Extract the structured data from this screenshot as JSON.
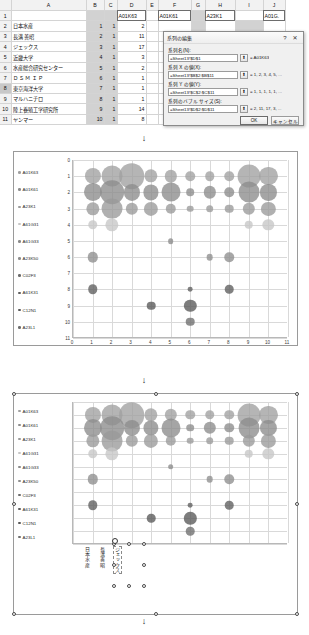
{
  "app": {
    "type": "spreadsheet-bubble-chart-editor"
  },
  "sheet": {
    "column_headers": [
      "A",
      "B",
      "C",
      "D",
      "E",
      "F",
      "G",
      "H",
      "I",
      "J"
    ],
    "row_headers": [
      "1",
      "2",
      "3",
      "4",
      "5",
      "6",
      "7",
      "8",
      "9",
      "10",
      "11"
    ],
    "series_name_cells": {
      "D1": "A01K63",
      "F1": "A01K61",
      "H1": "A23K1",
      "J1": "A01G."
    },
    "row1_numbers": {
      "D2_row": "",
      "E1": "2",
      "F1b": "18",
      "G1": "3",
      "H1b": "12",
      "I1": "4"
    },
    "rows": [
      {
        "r": "2",
        "A": "日本水産",
        "B": "1",
        "C": "1",
        "D": "2"
      },
      {
        "r": "3",
        "A": "長溝 善昭",
        "B": "2",
        "C": "1",
        "D": "11"
      },
      {
        "r": "4",
        "A": "ジェックス",
        "B": "3",
        "C": "1",
        "D": "17"
      },
      {
        "r": "5",
        "A": "近畿大学",
        "B": "4",
        "C": "1",
        "D": "3"
      },
      {
        "r": "6",
        "A": "水産総合研究センター",
        "B": "5",
        "C": "1",
        "D": "2"
      },
      {
        "r": "7",
        "A": "Ｄ Ｓ Ｍ   Ｉ Ｐ",
        "B": "6",
        "C": "1",
        "D": "1"
      },
      {
        "r": "8",
        "A": "東京海洋大学",
        "B": "7",
        "C": "1",
        "D": "1"
      },
      {
        "r": "9",
        "A": "マルハニチロ",
        "B": "8",
        "C": "1",
        "D": "1"
      },
      {
        "r": "10",
        "A": "陸上養殖工学研究所",
        "B": "9",
        "C": "1",
        "D": "14"
      },
      {
        "r": "11",
        "A": "ヤンマー",
        "B": "10",
        "C": "1",
        "D": "8"
      }
    ],
    "selected_row_header": "8",
    "selected_cell": "D1"
  },
  "dialog": {
    "title": "系列の編集",
    "help_label": "?",
    "close_label": "✕",
    "fields": [
      {
        "label": "系列名(N):",
        "value": "=Sheet13!$D$1",
        "preview": "= A01K63"
      },
      {
        "label": "系列 X の値(X):",
        "value": "=Sheet13!$B$2:$B$11",
        "preview": "= 1, 2, 3, 4, 5, ..."
      },
      {
        "label": "系列 Y の値(Y):",
        "value": "=Sheet13!$C$2:$C$11",
        "preview": "= 1, 1, 1, 1, 1, ..."
      },
      {
        "label": "系列のバブル サイズ(S):",
        "value": "=Sheet13!$D$2:$D$11",
        "preview": "= 2, 11, 17, 3, ..."
      }
    ],
    "picker_icon": "range-picker-icon",
    "ok_label": "OK",
    "cancel_label": "キャンセル"
  },
  "chart_data": [
    {
      "id": "chart1",
      "type": "scatter",
      "title": "",
      "xlabel": "",
      "ylabel": "",
      "xlim": [
        0,
        11
      ],
      "ylim": [
        0,
        11
      ],
      "y_inverted": true,
      "grid": true,
      "legend_position": "left",
      "xticks": [
        "0",
        "1",
        "2",
        "3",
        "4",
        "5",
        "6",
        "7",
        "8",
        "9",
        "10",
        "11"
      ],
      "yticks": [
        "0",
        "1",
        "2",
        "3",
        "4",
        "5",
        "6",
        "7",
        "8",
        "9",
        "10",
        "11"
      ],
      "series": [
        {
          "name": "A01K63",
          "color": "#a0a0a0",
          "points": [
            [
              1,
              1,
              17
            ],
            [
              2,
              1,
              22
            ],
            [
              3,
              1,
              27
            ],
            [
              4,
              1,
              14
            ],
            [
              5,
              1,
              13
            ],
            [
              6,
              1,
              10
            ],
            [
              7,
              1,
              10
            ],
            [
              8,
              1,
              10
            ],
            [
              9,
              1,
              24
            ],
            [
              10,
              1,
              19
            ]
          ]
        },
        {
          "name": "A01K61",
          "color": "#8c8c8c",
          "points": [
            [
              1,
              2,
              19
            ],
            [
              2,
              2,
              25
            ],
            [
              3,
              2,
              17
            ],
            [
              4,
              2,
              16
            ],
            [
              5,
              2,
              20
            ],
            [
              6,
              2,
              8
            ],
            [
              7,
              2,
              13
            ],
            [
              8,
              2,
              10
            ],
            [
              9,
              2,
              22
            ],
            [
              10,
              2,
              17
            ]
          ]
        },
        {
          "name": "A23K1",
          "color": "#9a9a9a",
          "points": [
            [
              1,
              3,
              14
            ],
            [
              2,
              3,
              22
            ],
            [
              3,
              3,
              13
            ],
            [
              4,
              3,
              15
            ],
            [
              5,
              3,
              11
            ],
            [
              6,
              3,
              7
            ],
            [
              7,
              3,
              8
            ],
            [
              8,
              3,
              9
            ],
            [
              9,
              3,
              13
            ],
            [
              10,
              3,
              15
            ]
          ]
        },
        {
          "name": "A61G31",
          "color": "#c6c6c6",
          "points": [
            [
              1,
              4,
              10
            ],
            [
              2,
              4,
              14
            ],
            [
              9,
              4,
              9
            ],
            [
              10,
              4,
              12
            ]
          ]
        },
        {
          "name": "A61G33",
          "color": "#8a8a8a",
          "points": [
            [
              5,
              5,
              6
            ]
          ]
        },
        {
          "name": "A23K50",
          "color": "#8e8e8e",
          "points": [
            [
              1,
              6,
              11
            ],
            [
              7,
              6,
              7
            ],
            [
              8,
              6,
              10
            ]
          ]
        },
        {
          "name": "C02F3",
          "color": "#6b6b6b",
          "points": []
        },
        {
          "name": "A61K31",
          "color": "#5e5e5e",
          "points": [
            [
              1,
              8,
              10
            ],
            [
              6,
              8,
              5
            ],
            [
              8,
              8,
              9
            ]
          ]
        },
        {
          "name": "C12N1",
          "color": "#585858",
          "points": [
            [
              4,
              9,
              9
            ],
            [
              6,
              9,
              13
            ]
          ]
        },
        {
          "name": "A23L1",
          "color": "#6e6e6e",
          "points": [
            [
              6,
              10,
              9
            ]
          ]
        }
      ]
    },
    {
      "id": "chart2",
      "type": "scatter",
      "title": "",
      "xlabel": "",
      "ylabel": "",
      "xlim": [
        0,
        11
      ],
      "ylim": [
        0,
        11
      ],
      "y_inverted": true,
      "grid": true,
      "legend_position": "left",
      "category_labels": [
        "日本水産",
        "長溝善昭",
        "ジェックス"
      ],
      "series": [
        {
          "name": "A01K63",
          "color": "#a0a0a0",
          "points": [
            [
              1,
              1,
              17
            ],
            [
              2,
              1,
              22
            ],
            [
              3,
              1,
              27
            ],
            [
              4,
              1,
              14
            ],
            [
              5,
              1,
              13
            ],
            [
              6,
              1,
              10
            ],
            [
              7,
              1,
              10
            ],
            [
              8,
              1,
              10
            ],
            [
              9,
              1,
              24
            ],
            [
              10,
              1,
              19
            ]
          ]
        },
        {
          "name": "A01K61",
          "color": "#8c8c8c",
          "points": [
            [
              1,
              2,
              19
            ],
            [
              2,
              2,
              25
            ],
            [
              3,
              2,
              17
            ],
            [
              4,
              2,
              16
            ],
            [
              5,
              2,
              20
            ],
            [
              6,
              2,
              8
            ],
            [
              7,
              2,
              13
            ],
            [
              8,
              2,
              10
            ],
            [
              9,
              2,
              22
            ],
            [
              10,
              2,
              17
            ]
          ]
        },
        {
          "name": "A23K1",
          "color": "#9a9a9a",
          "points": [
            [
              1,
              3,
              14
            ],
            [
              2,
              3,
              22
            ],
            [
              3,
              3,
              13
            ],
            [
              4,
              3,
              15
            ],
            [
              5,
              3,
              11
            ],
            [
              6,
              3,
              7
            ],
            [
              7,
              3,
              8
            ],
            [
              8,
              3,
              9
            ],
            [
              9,
              3,
              13
            ],
            [
              10,
              3,
              15
            ]
          ]
        },
        {
          "name": "A61G31",
          "color": "#c6c6c6",
          "points": [
            [
              1,
              4,
              10
            ],
            [
              2,
              4,
              14
            ],
            [
              9,
              4,
              9
            ],
            [
              10,
              4,
              12
            ]
          ]
        },
        {
          "name": "A61G33",
          "color": "#8a8a8a",
          "points": [
            [
              5,
              5,
              6
            ]
          ]
        },
        {
          "name": "A23K50",
          "color": "#8e8e8e",
          "points": [
            [
              1,
              6,
              11
            ],
            [
              7,
              6,
              7
            ],
            [
              8,
              6,
              10
            ]
          ]
        },
        {
          "name": "C02F3",
          "color": "#6b6b6b",
          "points": []
        },
        {
          "name": "A61K31",
          "color": "#5e5e5e",
          "points": [
            [
              1,
              8,
              10
            ],
            [
              6,
              8,
              5
            ],
            [
              8,
              8,
              9
            ]
          ]
        },
        {
          "name": "C12N1",
          "color": "#585858",
          "points": [
            [
              4,
              9,
              9
            ],
            [
              6,
              9,
              13
            ]
          ]
        },
        {
          "name": "A23L1",
          "color": "#6e6e6e",
          "points": [
            [
              6,
              10,
              9
            ]
          ]
        }
      ]
    }
  ]
}
